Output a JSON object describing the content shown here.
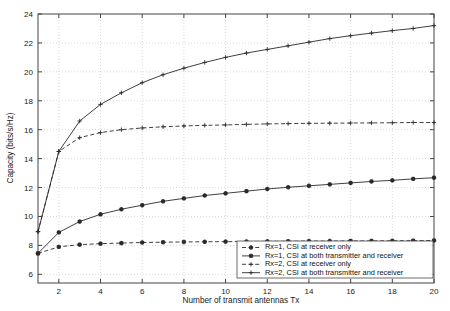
{
  "chart_data": {
    "type": "line",
    "title": "",
    "xlabel": "Number of transmit antennas Tx",
    "ylabel": "Capacity (bits/s/Hz)",
    "xlim": [
      1,
      20
    ],
    "ylim": [
      5.4,
      24
    ],
    "xticks": [
      2,
      4,
      6,
      8,
      10,
      12,
      14,
      16,
      18,
      20
    ],
    "yticks": [
      6,
      8,
      10,
      12,
      14,
      16,
      18,
      20,
      22,
      24
    ],
    "grid": true,
    "legend_position": "bottom-right",
    "x": [
      1,
      2,
      3,
      4,
      5,
      6,
      7,
      8,
      9,
      10,
      11,
      12,
      13,
      14,
      15,
      16,
      17,
      18,
      19,
      20
    ],
    "series": [
      {
        "name": "Rx=1, CSI at receiver only",
        "marker": "star",
        "linestyle": "dashed",
        "values": [
          7.45,
          7.9,
          8.05,
          8.12,
          8.16,
          8.2,
          8.22,
          8.24,
          8.25,
          8.26,
          8.27,
          8.28,
          8.29,
          8.3,
          8.3,
          8.31,
          8.31,
          8.32,
          8.33,
          8.34
        ]
      },
      {
        "name": "Rx=1, CSI at both transmitter and receiver",
        "marker": "star",
        "linestyle": "solid",
        "values": [
          7.45,
          8.9,
          9.65,
          10.15,
          10.5,
          10.78,
          11.05,
          11.25,
          11.45,
          11.6,
          11.75,
          11.9,
          12.02,
          12.12,
          12.22,
          12.32,
          12.42,
          12.5,
          12.6,
          12.68
        ]
      },
      {
        "name": "Rx=2, CSI at receiver only",
        "marker": "plus",
        "linestyle": "dashed",
        "values": [
          8.95,
          14.5,
          15.45,
          15.8,
          16.0,
          16.12,
          16.2,
          16.26,
          16.3,
          16.33,
          16.37,
          16.4,
          16.42,
          16.44,
          16.45,
          16.46,
          16.47,
          16.48,
          16.5,
          16.5
        ]
      },
      {
        "name": "Rx=2, CSI at both transmitter and receiver",
        "marker": "plus",
        "linestyle": "solid",
        "values": [
          8.95,
          14.5,
          16.6,
          17.75,
          18.55,
          19.25,
          19.8,
          20.25,
          20.65,
          21.0,
          21.3,
          21.55,
          21.8,
          22.05,
          22.3,
          22.5,
          22.68,
          22.85,
          23.0,
          23.2
        ]
      }
    ],
    "colors": {
      "line": "#2a2a2a",
      "grid": "#c8c8c8",
      "axis": "#444444",
      "background": "#ffffff"
    }
  }
}
